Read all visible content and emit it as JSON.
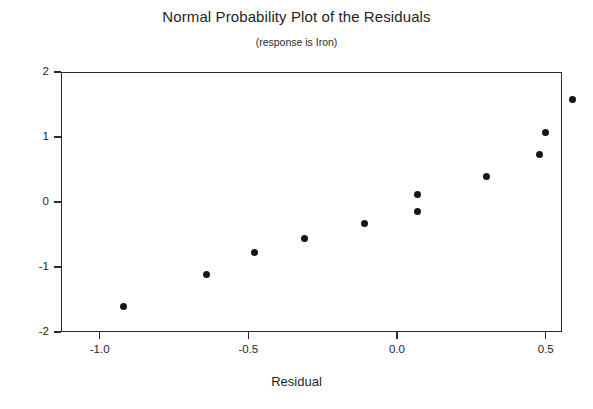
{
  "chart_data": {
    "type": "scatter",
    "title": "Normal Probability Plot of the Residuals",
    "subtitle": "(response is Iron)",
    "xlabel": "Residual",
    "ylabel": "",
    "xlim": [
      -1.13,
      0.555
    ],
    "ylim": [
      -2.0,
      2.0
    ],
    "grid": false,
    "legend": "none",
    "xticks": [
      -1.0,
      -0.5,
      0.0,
      0.5
    ],
    "xtick_labels": [
      "-1.0",
      "-0.5",
      "0.0",
      "0.5"
    ],
    "yticks": [
      -2,
      -1,
      0,
      1,
      2
    ],
    "ytick_labels": [
      "-2",
      "-1",
      "0",
      "1",
      "2"
    ],
    "x": [
      -0.92,
      -0.64,
      -0.48,
      -0.31,
      -0.11,
      0.07,
      0.07,
      0.3,
      0.48,
      0.5,
      0.59
    ],
    "y": [
      -1.6,
      -1.12,
      -0.78,
      -0.56,
      -0.33,
      -0.14,
      0.11,
      0.39,
      0.73,
      1.07,
      1.57
    ],
    "points": [
      {
        "x": -0.92,
        "y": -1.6
      },
      {
        "x": -0.64,
        "y": -1.12
      },
      {
        "x": -0.48,
        "y": -0.78
      },
      {
        "x": -0.31,
        "y": -0.56
      },
      {
        "x": -0.11,
        "y": -0.33
      },
      {
        "x": 0.07,
        "y": -0.14
      },
      {
        "x": 0.07,
        "y": 0.11
      },
      {
        "x": 0.3,
        "y": 0.39
      },
      {
        "x": 0.48,
        "y": 0.73
      },
      {
        "x": 0.5,
        "y": 1.07
      },
      {
        "x": 0.59,
        "y": 1.57
      }
    ],
    "marker_color": "#161616",
    "axis_color": "#2b2b2b"
  }
}
